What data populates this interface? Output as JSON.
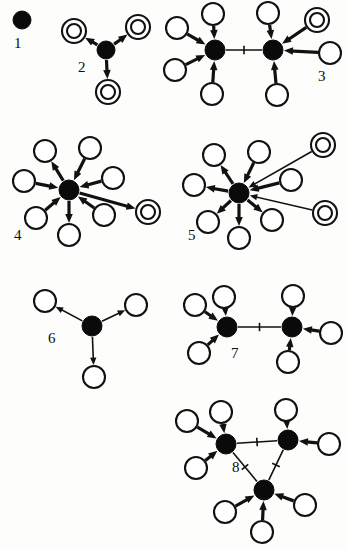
{
  "figure": {
    "background_color": "#fdfdfc",
    "ink_color": "#111111",
    "node_fill_hub": "#0a0a0a",
    "node_fill_leaf": "#ffffff",
    "width": 348,
    "height": 549
  },
  "diagrams": [
    {
      "id": "diagram-1",
      "label": "1",
      "label_pos": [
        14,
        48
      ],
      "hubs": [
        {
          "x": 22,
          "y": 20,
          "r": 9
        }
      ],
      "leaves": [],
      "rings": [],
      "edges": []
    },
    {
      "id": "diagram-2",
      "label": "2",
      "label_pos": [
        78,
        72
      ],
      "hubs": [
        {
          "x": 106,
          "y": 50,
          "r": 9
        }
      ],
      "leaves": [],
      "rings": [
        {
          "x": 74,
          "y": 31,
          "r_outer": 12,
          "r_inner": 7
        },
        {
          "x": 138,
          "y": 27,
          "r_outer": 12,
          "r_inner": 7
        },
        {
          "x": 108,
          "y": 92,
          "r_outer": 12,
          "r_inner": 7
        }
      ],
      "edges": [
        {
          "from": [
            106,
            50
          ],
          "to": [
            74,
            31
          ],
          "dir": "out",
          "weight": "thick"
        },
        {
          "from": [
            106,
            50
          ],
          "to": [
            138,
            27
          ],
          "dir": "out",
          "weight": "thick"
        },
        {
          "from": [
            106,
            50
          ],
          "to": [
            108,
            92
          ],
          "dir": "out",
          "weight": "thick"
        }
      ]
    },
    {
      "id": "diagram-3",
      "label": "3",
      "label_pos": [
        318,
        81
      ],
      "hubs": [
        {
          "x": 215,
          "y": 50,
          "r": 10
        },
        {
          "x": 273,
          "y": 50,
          "r": 10
        }
      ],
      "leaves": [
        {
          "x": 213,
          "y": 14,
          "r": 11
        },
        {
          "x": 177,
          "y": 28,
          "r": 11
        },
        {
          "x": 175,
          "y": 70,
          "r": 11
        },
        {
          "x": 212,
          "y": 94,
          "r": 11
        },
        {
          "x": 268,
          "y": 13,
          "r": 11
        },
        {
          "x": 330,
          "y": 53,
          "r": 11
        },
        {
          "x": 277,
          "y": 95,
          "r": 11
        }
      ],
      "rings": [
        {
          "x": 317,
          "y": 20,
          "r_outer": 12,
          "r_inner": 7
        }
      ],
      "edges": [
        {
          "from": [
            213,
            14
          ],
          "to": [
            215,
            50
          ],
          "dir": "in",
          "weight": "thick"
        },
        {
          "from": [
            177,
            28
          ],
          "to": [
            215,
            50
          ],
          "dir": "in",
          "weight": "thick"
        },
        {
          "from": [
            175,
            70
          ],
          "to": [
            215,
            50
          ],
          "dir": "in",
          "weight": "thick"
        },
        {
          "from": [
            212,
            94
          ],
          "to": [
            215,
            50
          ],
          "dir": "in",
          "weight": "thick"
        },
        {
          "from": [
            268,
            13
          ],
          "to": [
            273,
            50
          ],
          "dir": "in",
          "weight": "thick"
        },
        {
          "from": [
            317,
            20
          ],
          "to": [
            273,
            50
          ],
          "dir": "in",
          "weight": "thick"
        },
        {
          "from": [
            330,
            53
          ],
          "to": [
            273,
            50
          ],
          "dir": "in",
          "weight": "thick"
        },
        {
          "from": [
            277,
            95
          ],
          "to": [
            273,
            50
          ],
          "dir": "in",
          "weight": "thick"
        },
        {
          "from": [
            215,
            50
          ],
          "to": [
            273,
            50
          ],
          "dir": "tick",
          "weight": "thin"
        }
      ]
    },
    {
      "id": "diagram-4",
      "label": "4",
      "label_pos": [
        14,
        240
      ],
      "hubs": [
        {
          "x": 69,
          "y": 190,
          "r": 10
        }
      ],
      "leaves": [
        {
          "x": 45,
          "y": 151,
          "r": 11
        },
        {
          "x": 90,
          "y": 148,
          "r": 11
        },
        {
          "x": 113,
          "y": 178,
          "r": 11
        },
        {
          "x": 24,
          "y": 181,
          "r": 11
        },
        {
          "x": 36,
          "y": 218,
          "r": 11
        },
        {
          "x": 69,
          "y": 235,
          "r": 11
        },
        {
          "x": 104,
          "y": 215,
          "r": 11
        }
      ],
      "rings": [
        {
          "x": 148,
          "y": 212,
          "r_outer": 12,
          "r_inner": 7
        }
      ],
      "edges": [
        {
          "from": [
            69,
            190
          ],
          "to": [
            45,
            151
          ],
          "dir": "out",
          "weight": "thick"
        },
        {
          "from": [
            90,
            148
          ],
          "to": [
            69,
            190
          ],
          "dir": "in",
          "weight": "thick"
        },
        {
          "from": [
            113,
            178
          ],
          "to": [
            69,
            190
          ],
          "dir": "in",
          "weight": "thick"
        },
        {
          "from": [
            24,
            181
          ],
          "to": [
            69,
            190
          ],
          "dir": "in",
          "weight": "thick"
        },
        {
          "from": [
            36,
            218
          ],
          "to": [
            69,
            190
          ],
          "dir": "in",
          "weight": "thick"
        },
        {
          "from": [
            69,
            190
          ],
          "to": [
            69,
            235
          ],
          "dir": "out",
          "weight": "thick"
        },
        {
          "from": [
            104,
            215
          ],
          "to": [
            69,
            190
          ],
          "dir": "in",
          "weight": "thick"
        },
        {
          "from": [
            69,
            190
          ],
          "to": [
            148,
            212
          ],
          "dir": "out",
          "weight": "thick"
        }
      ]
    },
    {
      "id": "diagram-5",
      "label": "5",
      "label_pos": [
        188,
        240
      ],
      "hubs": [
        {
          "x": 239,
          "y": 193,
          "r": 10
        }
      ],
      "leaves": [
        {
          "x": 214,
          "y": 155,
          "r": 11
        },
        {
          "x": 259,
          "y": 152,
          "r": 11
        },
        {
          "x": 291,
          "y": 180,
          "r": 11
        },
        {
          "x": 194,
          "y": 185,
          "r": 11
        },
        {
          "x": 208,
          "y": 222,
          "r": 11
        },
        {
          "x": 239,
          "y": 238,
          "r": 11
        },
        {
          "x": 272,
          "y": 220,
          "r": 11
        }
      ],
      "rings": [
        {
          "x": 323,
          "y": 145,
          "r_outer": 12,
          "r_inner": 7
        },
        {
          "x": 325,
          "y": 213,
          "r_outer": 12,
          "r_inner": 7
        }
      ],
      "edges": [
        {
          "from": [
            239,
            193
          ],
          "to": [
            214,
            155
          ],
          "dir": "out",
          "weight": "thick"
        },
        {
          "from": [
            259,
            152
          ],
          "to": [
            239,
            193
          ],
          "dir": "in",
          "weight": "thick"
        },
        {
          "from": [
            291,
            180
          ],
          "to": [
            239,
            193
          ],
          "dir": "out",
          "weight": "thick"
        },
        {
          "from": [
            239,
            193
          ],
          "to": [
            194,
            185
          ],
          "dir": "out",
          "weight": "thick"
        },
        {
          "from": [
            239,
            193
          ],
          "to": [
            208,
            222
          ],
          "dir": "out",
          "weight": "thick"
        },
        {
          "from": [
            239,
            193
          ],
          "to": [
            239,
            238
          ],
          "dir": "out",
          "weight": "thick"
        },
        {
          "from": [
            239,
            193
          ],
          "to": [
            272,
            220
          ],
          "dir": "out",
          "weight": "thick"
        },
        {
          "from": [
            323,
            145
          ],
          "to": [
            239,
            193
          ],
          "dir": "in",
          "weight": "thin"
        },
        {
          "from": [
            325,
            213
          ],
          "to": [
            239,
            193
          ],
          "dir": "in",
          "weight": "thin"
        }
      ]
    },
    {
      "id": "diagram-6",
      "label": "6",
      "label_pos": [
        48,
        343
      ],
      "hubs": [
        {
          "x": 92,
          "y": 326,
          "r": 10
        }
      ],
      "leaves": [
        {
          "x": 45,
          "y": 301,
          "r": 11
        },
        {
          "x": 136,
          "y": 305,
          "r": 11
        },
        {
          "x": 94,
          "y": 377,
          "r": 11
        }
      ],
      "rings": [],
      "edges": [
        {
          "from": [
            92,
            326
          ],
          "to": [
            45,
            301
          ],
          "dir": "out",
          "weight": "thin"
        },
        {
          "from": [
            92,
            326
          ],
          "to": [
            136,
            305
          ],
          "dir": "out",
          "weight": "thin"
        },
        {
          "from": [
            92,
            326
          ],
          "to": [
            94,
            377
          ],
          "dir": "out",
          "weight": "thin"
        }
      ]
    },
    {
      "id": "diagram-7",
      "label": "7",
      "label_pos": [
        231,
        358
      ],
      "hubs": [
        {
          "x": 227,
          "y": 327,
          "r": 10
        },
        {
          "x": 292,
          "y": 327,
          "r": 10
        }
      ],
      "leaves": [
        {
          "x": 224,
          "y": 297,
          "r": 11
        },
        {
          "x": 195,
          "y": 305,
          "r": 11
        },
        {
          "x": 199,
          "y": 353,
          "r": 11
        },
        {
          "x": 293,
          "y": 296,
          "r": 11
        },
        {
          "x": 331,
          "y": 333,
          "r": 11
        },
        {
          "x": 288,
          "y": 362,
          "r": 11
        }
      ],
      "rings": [],
      "edges": [
        {
          "from": [
            224,
            297
          ],
          "to": [
            227,
            327
          ],
          "dir": "in",
          "weight": "thick"
        },
        {
          "from": [
            195,
            305
          ],
          "to": [
            227,
            327
          ],
          "dir": "in",
          "weight": "thick"
        },
        {
          "from": [
            199,
            353
          ],
          "to": [
            227,
            327
          ],
          "dir": "in",
          "weight": "thick"
        },
        {
          "from": [
            293,
            296
          ],
          "to": [
            292,
            327
          ],
          "dir": "in",
          "weight": "thick"
        },
        {
          "from": [
            331,
            333
          ],
          "to": [
            292,
            327
          ],
          "dir": "in",
          "weight": "thick"
        },
        {
          "from": [
            288,
            362
          ],
          "to": [
            292,
            327
          ],
          "dir": "in",
          "weight": "thick"
        },
        {
          "from": [
            227,
            327
          ],
          "to": [
            292,
            327
          ],
          "dir": "tick",
          "weight": "thin"
        }
      ]
    },
    {
      "id": "diagram-8",
      "label": "8",
      "label_pos": [
        232,
        472
      ],
      "hubs": [
        {
          "x": 226,
          "y": 444,
          "r": 10
        },
        {
          "x": 288,
          "y": 440,
          "r": 10
        },
        {
          "x": 264,
          "y": 490,
          "r": 10
        }
      ],
      "leaves": [
        {
          "x": 221,
          "y": 412,
          "r": 11
        },
        {
          "x": 187,
          "y": 421,
          "r": 11
        },
        {
          "x": 196,
          "y": 468,
          "r": 11
        },
        {
          "x": 286,
          "y": 410,
          "r": 11
        },
        {
          "x": 329,
          "y": 444,
          "r": 11
        },
        {
          "x": 305,
          "y": 505,
          "r": 11
        },
        {
          "x": 262,
          "y": 532,
          "r": 11
        },
        {
          "x": 225,
          "y": 512,
          "r": 11
        }
      ],
      "rings": [],
      "edges": [
        {
          "from": [
            221,
            412
          ],
          "to": [
            226,
            444
          ],
          "dir": "in",
          "weight": "thick"
        },
        {
          "from": [
            187,
            421
          ],
          "to": [
            226,
            444
          ],
          "dir": "in",
          "weight": "thick"
        },
        {
          "from": [
            196,
            468
          ],
          "to": [
            226,
            444
          ],
          "dir": "in",
          "weight": "thick"
        },
        {
          "from": [
            286,
            410
          ],
          "to": [
            288,
            440
          ],
          "dir": "in",
          "weight": "thick"
        },
        {
          "from": [
            329,
            444
          ],
          "to": [
            288,
            440
          ],
          "dir": "in",
          "weight": "thick"
        },
        {
          "from": [
            305,
            505
          ],
          "to": [
            264,
            490
          ],
          "dir": "in",
          "weight": "thick"
        },
        {
          "from": [
            262,
            532
          ],
          "to": [
            264,
            490
          ],
          "dir": "in",
          "weight": "thick"
        },
        {
          "from": [
            225,
            512
          ],
          "to": [
            264,
            490
          ],
          "dir": "in",
          "weight": "thick"
        },
        {
          "from": [
            226,
            444
          ],
          "to": [
            288,
            440
          ],
          "dir": "tick",
          "weight": "thin"
        },
        {
          "from": [
            264,
            490
          ],
          "to": [
            226,
            444
          ],
          "dir": "tick",
          "weight": "thin"
        },
        {
          "from": [
            264,
            490
          ],
          "to": [
            288,
            440
          ],
          "dir": "tick",
          "weight": "thin"
        }
      ]
    }
  ]
}
